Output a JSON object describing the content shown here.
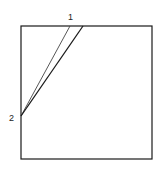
{
  "diagram": {
    "labels": {
      "point_1": "1",
      "point_2": "2"
    },
    "colors": {
      "stroke": "#1a1a1a",
      "thin_stroke": "#444444",
      "background": "#ffffff"
    }
  }
}
